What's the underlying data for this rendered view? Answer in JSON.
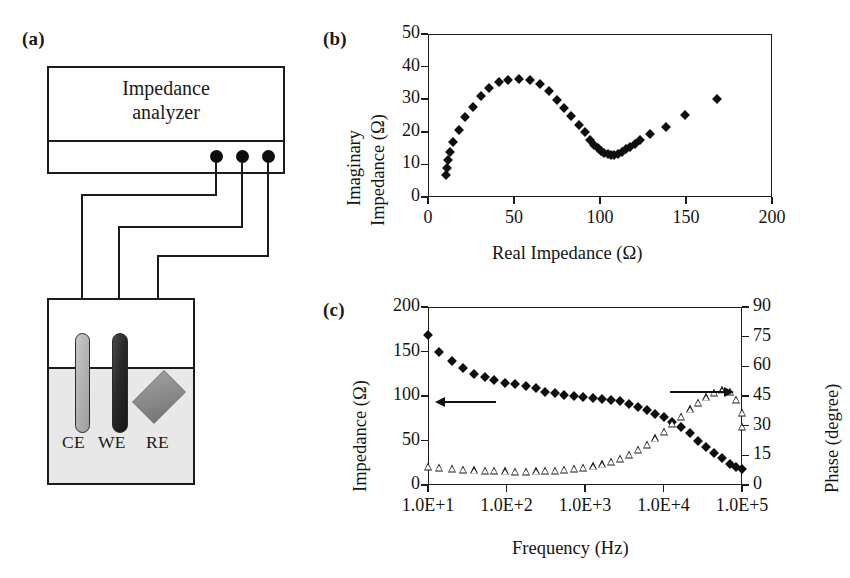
{
  "figure": {
    "panel_a_label": "(a)",
    "panel_b_label": "(b)",
    "panel_c_label": "(c)"
  },
  "schematic": {
    "instrument_line1": "Impedance",
    "instrument_line2": "analyzer",
    "terminal_count": 3,
    "electrodes": [
      {
        "id": "CE",
        "label": "CE",
        "color": "#b4b4b4",
        "shape": "rod"
      },
      {
        "id": "WE",
        "label": "WE",
        "color": "#2a2a2a",
        "shape": "rod"
      },
      {
        "id": "RE",
        "label": "RE",
        "color": "#8a8a8a",
        "shape": "diamond"
      }
    ],
    "electrolyte_color": "#e8e8e8"
  },
  "chart_data": [
    {
      "panel": "(b)",
      "type": "scatter",
      "title": "",
      "xlabel": "Real Impedance (Ω)",
      "ylabel": "Imaginary Impedance (Ω)",
      "ylabel_line1": "Imaginary",
      "ylabel_line2": "Impedance (Ω)",
      "xlim": [
        0,
        200
      ],
      "ylim": [
        0,
        50
      ],
      "xticks": [
        0,
        50,
        100,
        150,
        200
      ],
      "yticks": [
        0,
        10,
        20,
        30,
        40,
        50
      ],
      "grid": false,
      "legend": "none",
      "marker": "filled-diamond",
      "series": [
        {
          "name": "Nyquist",
          "points": [
            [
              10.5,
              6.6
            ],
            [
              11.0,
              8.9
            ],
            [
              11.8,
              11.3
            ],
            [
              12.8,
              13.7
            ],
            [
              14.6,
              16.9
            ],
            [
              17.8,
              20.5
            ],
            [
              21.8,
              24.4
            ],
            [
              26.0,
              27.6
            ],
            [
              30.6,
              31.0
            ],
            [
              35.4,
              33.5
            ],
            [
              41.0,
              35.3
            ],
            [
              46.8,
              35.8
            ],
            [
              52.8,
              36.2
            ],
            [
              59.2,
              35.9
            ],
            [
              65.0,
              34.6
            ],
            [
              70.6,
              32.4
            ],
            [
              75.0,
              29.8
            ],
            [
              79.2,
              27.4
            ],
            [
              83.4,
              24.7
            ],
            [
              87.6,
              22.2
            ],
            [
              91.0,
              19.8
            ],
            [
              94.0,
              17.6
            ],
            [
              96.6,
              16.0
            ],
            [
              98.8,
              14.9
            ],
            [
              100.8,
              14.2
            ],
            [
              102.6,
              13.6
            ],
            [
              104.4,
              13.2
            ],
            [
              106.4,
              13.0
            ],
            [
              108.4,
              12.9
            ],
            [
              110.6,
              13.3
            ],
            [
              112.8,
              13.9
            ],
            [
              115.0,
              14.6
            ],
            [
              117.4,
              15.4
            ],
            [
              120.2,
              16.3
            ],
            [
              123.4,
              17.6
            ],
            [
              128.8,
              19.3
            ],
            [
              138.2,
              21.4
            ],
            [
              149.6,
              25.2
            ],
            [
              167.8,
              30.1
            ]
          ]
        }
      ]
    },
    {
      "panel": "(c)",
      "type": "scatter",
      "title": "",
      "xlabel": "Frequency (Hz)",
      "ylabel_left": "Impedance (Ω)",
      "ylabel_right": "Phase (degree)",
      "xscale": "log",
      "xlim": [
        10,
        100000
      ],
      "xticks": [
        10,
        100,
        1000,
        10000,
        100000
      ],
      "xticklabels": [
        "1.0E+1",
        "1.0E+2",
        "1.0E+3",
        "1.0E+4",
        "1.0E+5"
      ],
      "ylim_left": [
        0,
        200
      ],
      "yticks_left": [
        0,
        50,
        100,
        150,
        200
      ],
      "ylim_right": [
        0,
        90
      ],
      "yticks_right": [
        0,
        15,
        30,
        45,
        60,
        75,
        90
      ],
      "grid": false,
      "annotations": [
        {
          "name": "left-axis-arrow",
          "direction": "left",
          "points_to": "Impedance (Ω)"
        },
        {
          "name": "right-axis-arrow",
          "direction": "right",
          "points_to": "Phase (degree)"
        }
      ],
      "series": [
        {
          "name": "Impedance",
          "axis": "left",
          "marker": "filled-diamond",
          "points": [
            [
              10,
              168
            ],
            [
              14,
              150
            ],
            [
              20,
              139
            ],
            [
              28,
              131
            ],
            [
              39,
              125
            ],
            [
              54,
              121
            ],
            [
              70,
              118
            ],
            [
              96,
              115
            ],
            [
              130,
              113
            ],
            [
              175,
              111
            ],
            [
              235,
              109
            ],
            [
              310,
              105
            ],
            [
              410,
              103
            ],
            [
              545,
              101
            ],
            [
              720,
              100
            ],
            [
              950,
              99
            ],
            [
              1250,
              98
            ],
            [
              1650,
              97
            ],
            [
              2150,
              96
            ],
            [
              2800,
              94
            ],
            [
              3650,
              91
            ],
            [
              4750,
              88
            ],
            [
              6100,
              84
            ],
            [
              7900,
              80
            ],
            [
              10000,
              76
            ],
            [
              13000,
              71
            ],
            [
              16800,
              65
            ],
            [
              21500,
              58
            ],
            [
              27500,
              50
            ],
            [
              35000,
              43
            ],
            [
              44500,
              36
            ],
            [
              56000,
              30
            ],
            [
              70000,
              24
            ],
            [
              85000,
              20
            ],
            [
              100000,
              18
            ]
          ]
        },
        {
          "name": "Phase",
          "axis": "right",
          "marker": "open-triangle",
          "points": [
            [
              10,
              9
            ],
            [
              14,
              8.5
            ],
            [
              20,
              8
            ],
            [
              28,
              7.6
            ],
            [
              39,
              7.4
            ],
            [
              54,
              7.2
            ],
            [
              70,
              7.0
            ],
            [
              96,
              6.9
            ],
            [
              130,
              6.8
            ],
            [
              175,
              6.8
            ],
            [
              235,
              6.9
            ],
            [
              310,
              7.0
            ],
            [
              410,
              7.2
            ],
            [
              545,
              7.5
            ],
            [
              720,
              8.0
            ],
            [
              950,
              8.6
            ],
            [
              1250,
              9.4
            ],
            [
              1650,
              10.4
            ],
            [
              2150,
              11.6
            ],
            [
              2800,
              13.2
            ],
            [
              3650,
              15.2
            ],
            [
              4750,
              17.6
            ],
            [
              6100,
              20.4
            ],
            [
              7900,
              23.6
            ],
            [
              10000,
              27.0
            ],
            [
              13000,
              30.8
            ],
            [
              16800,
              34.6
            ],
            [
              21500,
              38.2
            ],
            [
              27500,
              41.5
            ],
            [
              35000,
              44.3
            ],
            [
              44500,
              46.5
            ],
            [
              56000,
              47.8
            ],
            [
              70000,
              47.0
            ],
            [
              85000,
              43.0
            ],
            [
              100000,
              36.5
            ],
            [
              100000,
              29.5
            ]
          ]
        }
      ]
    }
  ]
}
